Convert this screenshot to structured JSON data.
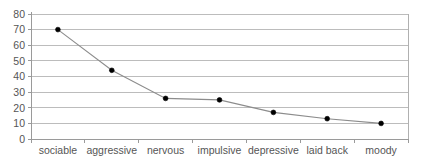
{
  "chart_data": {
    "type": "line",
    "title": "",
    "subtitle": "",
    "xlabel": "",
    "ylabel": "",
    "categories": [
      "sociable",
      "aggressive",
      "nervous",
      "impulsive",
      "depressive",
      "laid back",
      "moody"
    ],
    "values": [
      70,
      44,
      26,
      25,
      17,
      13,
      10
    ],
    "series": [
      {
        "name": "",
        "values": [
          70,
          44,
          26,
          25,
          17,
          13,
          10
        ]
      }
    ],
    "ylim": [
      0,
      80
    ],
    "ytick_labels": [
      "0",
      "10",
      "20",
      "30",
      "40",
      "50",
      "60",
      "70",
      "80"
    ],
    "ytick_values": [
      0,
      10,
      20,
      30,
      40,
      50,
      60,
      70,
      80
    ],
    "grid": true,
    "grid_axis": "y",
    "legend": false,
    "legend_position": "none",
    "marker": "dot",
    "colors": {
      "line": "#8c8c8c",
      "marker": "#000000",
      "grid": "#b5b5b5",
      "axis": "#9a9a9a",
      "text": "#555555",
      "background": "#ffffff"
    }
  },
  "plot": {
    "left": 31,
    "right": 408,
    "top": 14,
    "bottom": 139
  }
}
